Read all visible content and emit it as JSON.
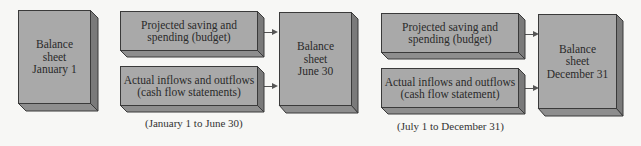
{
  "diagram": {
    "balance_sheets": [
      {
        "label": "Balance\nsheet\nJanuary 1"
      },
      {
        "label": "Balance\nsheet\nJune 30"
      },
      {
        "label": "Balance\nsheet\nDecember 31"
      }
    ],
    "period_1": {
      "budget_box": "Projected saving and\nspending (budget)",
      "cashflow_box": "Actual inflows and outflows\n(cash flow statements)",
      "caption": "(January 1 to June 30)"
    },
    "period_2": {
      "budget_box": "Projected saving and\nspending (budget)",
      "cashflow_box": "Actual inflows and outflows\n(cash flow statement)",
      "caption": "(July 1 to December 31)"
    },
    "colors": {
      "front_face": "#a9a9a9",
      "side_face": "#7a7a7a",
      "bottom_face": "#8e8e8e",
      "outline": "#3a3a3a",
      "background": "#f7f7f5"
    }
  }
}
